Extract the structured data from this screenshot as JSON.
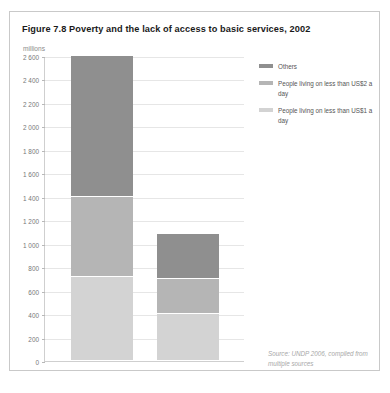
{
  "figure": {
    "title": "Figure 7.8 Poverty and the lack of access to basic services, 2002",
    "unit_label": "millions",
    "source": "Source: UNDP 2006, compiled from multiple sources"
  },
  "colors": {
    "others": "#8f8f8f",
    "us2_a_day": "#b5b5b5",
    "us1_a_day": "#d3d3d3",
    "gridline": "#e6e6e6",
    "axis": "#cfcfcf",
    "frame": "#c9c9c9",
    "title_text": "#1a1a1a",
    "tick_text": "#777777",
    "legend_text": "#555555",
    "source_text": "#a8a8a8"
  },
  "legend": {
    "position": "top-right",
    "items": [
      {
        "label": "Others",
        "color": "#8f8f8f"
      },
      {
        "label": "People living on less than US$2 a day",
        "color": "#b5b5b5"
      },
      {
        "label": "People living on less than US$1 a day",
        "color": "#d3d3d3"
      }
    ]
  },
  "chart_data": {
    "type": "bar",
    "title": "Figure 7.8 Poverty and the lack of access to basic services, 2002",
    "subtitle": "",
    "xlabel": "",
    "ylabel": "millions",
    "stacked": true,
    "grid": true,
    "legend_position": "top-right",
    "ylim": [
      0,
      2600
    ],
    "ytick_step": 200,
    "ytick_labels": [
      "0",
      "200",
      "400",
      "600",
      "800",
      "1 000",
      "1 200",
      "1 400",
      "1 600",
      "1 800",
      "2 000",
      "2 200",
      "2 400",
      "2 600"
    ],
    "ytick_values": [
      0,
      200,
      400,
      600,
      800,
      1000,
      1200,
      1400,
      1600,
      1800,
      2000,
      2200,
      2400,
      2600
    ],
    "categories": [
      "Sanitation",
      "Water"
    ],
    "series": [
      {
        "name": "People living on less than US$1 a day",
        "color": "#d3d3d3",
        "values": [
          720,
          400
        ]
      },
      {
        "name": "People living on less than US$2 a day",
        "color": "#b5b5b5",
        "values": [
          680,
          300
        ]
      },
      {
        "name": "Others",
        "color": "#8f8f8f",
        "values": [
          1200,
          380
        ]
      }
    ],
    "totals": [
      2600,
      1080
    ],
    "annotations": [
      "Source: UNDP 2006, compiled from multiple sources"
    ]
  }
}
